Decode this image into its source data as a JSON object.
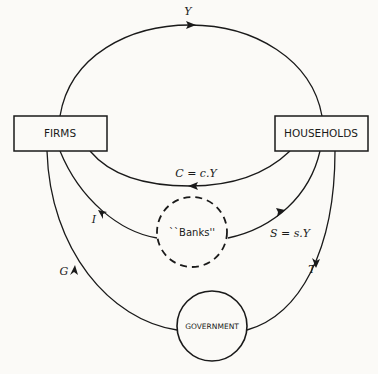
{
  "diagram": {
    "nodes": {
      "firms": "FIRMS",
      "households": "HOUSEHOLDS",
      "banks": "``Banks''",
      "government": "GOVERNMENT"
    },
    "flows": {
      "income": "Y",
      "consumption": "C = c.Y",
      "investment": "I",
      "saving": "S = s.Y",
      "government_spending": "G",
      "taxes": "T"
    }
  }
}
